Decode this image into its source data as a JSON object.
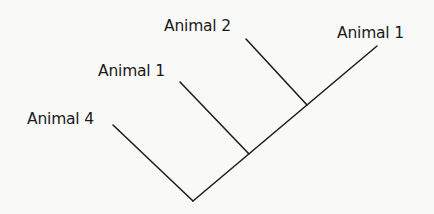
{
  "diagram": {
    "type": "cladogram",
    "line_color": "#1f1f1f",
    "background": "#f9f9f8",
    "root": {
      "x": 193,
      "y": 201
    },
    "trunk_end": {
      "x": 377,
      "y": 46
    },
    "nodes": [
      {
        "id": "node-a",
        "x": 249,
        "y": 154
      },
      {
        "id": "node-b",
        "x": 307,
        "y": 105
      }
    ],
    "branches": [
      {
        "id": "branch-animal-4",
        "from": {
          "x": 193,
          "y": 201
        },
        "to": {
          "x": 113,
          "y": 125
        }
      },
      {
        "id": "branch-animal-1-mid",
        "from": {
          "x": 249,
          "y": 154
        },
        "to": {
          "x": 180,
          "y": 82
        }
      },
      {
        "id": "branch-animal-2",
        "from": {
          "x": 307,
          "y": 105
        },
        "to": {
          "x": 246,
          "y": 39
        }
      },
      {
        "id": "branch-animal-1-right",
        "from": {
          "x": 193,
          "y": 201
        },
        "to": {
          "x": 377,
          "y": 46
        }
      }
    ],
    "labels": [
      {
        "id": "label-animal-4",
        "text": "Animal 4",
        "x": 27,
        "y": 112
      },
      {
        "id": "label-animal-1-mid",
        "text": "Animal 1",
        "x": 98,
        "y": 64
      },
      {
        "id": "label-animal-2",
        "text": "Animal 2",
        "x": 164,
        "y": 19
      },
      {
        "id": "label-animal-1-right",
        "text": "Animal 1",
        "x": 337,
        "y": 26
      }
    ]
  }
}
